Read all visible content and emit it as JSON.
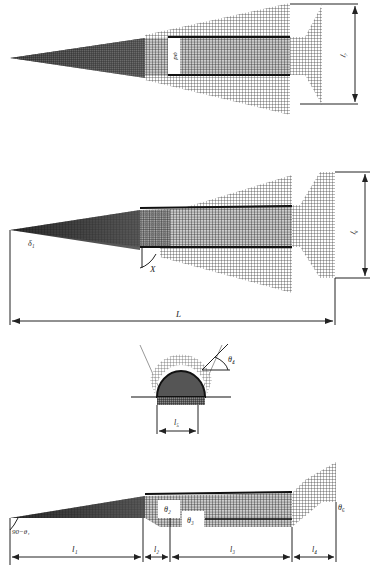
{
  "figure": {
    "views": [
      {
        "id": "top-view-upper",
        "labels": {
          "diameter": "φd",
          "height": "l₇"
        }
      },
      {
        "id": "top-view",
        "labels": {
          "nose_angle": "δ₁",
          "sweep_angle": "X",
          "length": "L",
          "height": "l₆"
        }
      },
      {
        "id": "front-view",
        "labels": {
          "angle": "θ₄",
          "width": "l₅"
        }
      },
      {
        "id": "side-view",
        "labels": {
          "nose_angle": "90−θ₁",
          "angle_2": "θ₂",
          "angle_3": "θ₃",
          "angle_6": "θ₆",
          "segment_1": "l₁",
          "segment_2": "l₂",
          "segment_3": "l₃",
          "segment_4": "l₄"
        }
      }
    ],
    "colors": {
      "mesh": "#2a2a2a",
      "mesh_dark": "#111111",
      "background": "#ffffff",
      "dim_line": "#222222"
    }
  }
}
